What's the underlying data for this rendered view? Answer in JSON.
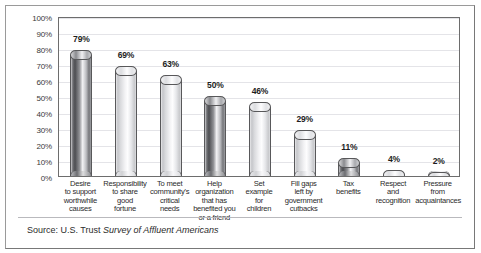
{
  "chart_data": {
    "type": "bar",
    "title": "",
    "subtitle": "",
    "xlabel": "",
    "ylabel": "",
    "ylim": [
      0,
      100
    ],
    "grid": true,
    "legend_position": "none",
    "y_tick_labels": [
      "100%",
      "90%",
      "80%",
      "70%",
      "60%",
      "50%",
      "40%",
      "30%",
      "20%",
      "10%",
      "0%"
    ],
    "y_tick_values": [
      100,
      90,
      80,
      70,
      60,
      50,
      40,
      30,
      20,
      10,
      0
    ],
    "categories": [
      "Desire to support worthwhile causes",
      "Responsibility to share good fortune",
      "To meet community's critical needs",
      "Help organization that has benefited you or a friend",
      "Set example for children",
      "Fill gaps left by government cutbacks",
      "Tax benefits",
      "Respect and recognition",
      "Pressure from acquaintances"
    ],
    "category_lines": [
      [
        "Desire",
        "to support",
        "worthwhile",
        "causes"
      ],
      [
        "Responsibility",
        "to share",
        "good",
        "fortune"
      ],
      [
        "To meet",
        "community's",
        "critical",
        "needs"
      ],
      [
        "Help",
        "organization",
        "that has",
        "benefited you",
        "or a friend"
      ],
      [
        "Set",
        "example",
        "for",
        "children"
      ],
      [
        "Fill gaps",
        "left by",
        "government",
        "cutbacks"
      ],
      [
        "Tax",
        "benefits"
      ],
      [
        "Respect",
        "and",
        "recognition"
      ],
      [
        "Pressure",
        "from",
        "acquaintances"
      ]
    ],
    "values": [
      79,
      69,
      63,
      50,
      46,
      29,
      11,
      4,
      2
    ],
    "data_labels": [
      "79%",
      "69%",
      "63%",
      "50%",
      "46%",
      "29%",
      "11%",
      "4%",
      "2%"
    ],
    "bar_shading": [
      "dark",
      "light",
      "light",
      "dark",
      "light",
      "light",
      "dark",
      "light",
      "light"
    ],
    "annotations": []
  },
  "source": {
    "prefix": "Source: U.S. Trust ",
    "publication": "Survey of Affluent Americans"
  },
  "colors": {
    "figure_border": "#9a9a9a",
    "plot_border": "#6d6d6d",
    "gridline": "#e4e4e8",
    "bar_dark": "#6f7074",
    "bar_light": "#e0e1e4",
    "text": "#2b2b2b",
    "background": "#ffffff"
  }
}
